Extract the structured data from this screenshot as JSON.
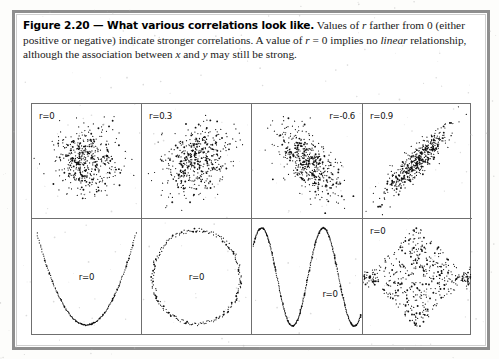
{
  "figure": {
    "label": "Figure 2.20 — What various correlations look like.",
    "body_part1": "Values of ",
    "r1": "r",
    "body_part2": " farther from 0 (either positive or negative) indicate stronger correlations.  A value of ",
    "r2": "r",
    "body_part3": " = 0 implies no ",
    "linear": "linear",
    "body_part4": " relationship, although the association between ",
    "x": "x",
    "body_part5": " and ",
    "y": "y",
    "body_part6": " may still be strong."
  },
  "colors": {
    "ink": "#1a1a1a",
    "frame": "#8e8e8e",
    "grid_line": "#6f6f6f",
    "point": "#101010",
    "paper": "#ffffff"
  },
  "chart_data": {
    "type": "scatter",
    "title": "What various correlations look like",
    "layout": {
      "rows": 2,
      "cols": 4,
      "grid": false,
      "axes_ticks": false,
      "legend": "none"
    },
    "panels": [
      {
        "id": "panel-r0-cloud",
        "row": 1,
        "col": 1,
        "label": "r=0",
        "label_position": "top-left",
        "shape": "round-cloud",
        "r": 0,
        "n": 480,
        "xlim": [
          -3,
          3
        ],
        "ylim": [
          -3,
          3
        ],
        "description": "Circular bivariate normal cloud, no linear trend"
      },
      {
        "id": "panel-r03",
        "row": 1,
        "col": 2,
        "label": "r=0.3",
        "label_position": "top-left",
        "shape": "tilted-cloud",
        "r": 0.3,
        "n": 480,
        "xlim": [
          -3,
          3
        ],
        "ylim": [
          -3,
          3
        ],
        "description": "Weak positive linear association"
      },
      {
        "id": "panel-r-06",
        "row": 1,
        "col": 3,
        "label": "r=-0.6",
        "label_position": "top-right",
        "shape": "tilted-cloud",
        "r": -0.6,
        "n": 480,
        "xlim": [
          -3,
          3
        ],
        "ylim": [
          -3,
          3
        ],
        "description": "Moderate negative linear association, downward slope"
      },
      {
        "id": "panel-r09",
        "row": 1,
        "col": 4,
        "label": "r=0.9",
        "label_position": "top-left",
        "shape": "tilted-cloud",
        "r": 0.9,
        "n": 480,
        "xlim": [
          -3,
          3
        ],
        "ylim": [
          -3,
          3
        ],
        "description": "Strong positive linear association, narrow diagonal band"
      },
      {
        "id": "panel-parabola",
        "row": 2,
        "col": 1,
        "label": "r=0",
        "label_position": "center",
        "shape": "parabola",
        "r": 0,
        "n": 150,
        "xlim": [
          -1,
          1
        ],
        "ylim": [
          0,
          1
        ],
        "description": "U-shaped quadratic curve, y = x^2, strong non-linear association"
      },
      {
        "id": "panel-circle",
        "row": 2,
        "col": 2,
        "label": "r=0",
        "label_position": "center",
        "shape": "circle",
        "r": 0,
        "n": 190,
        "xlim": [
          -1,
          1
        ],
        "ylim": [
          -1,
          1
        ],
        "description": "Ring of points on a circle"
      },
      {
        "id": "panel-sine",
        "row": 2,
        "col": 3,
        "label": "r=0",
        "label_position": "center-right",
        "shape": "sine",
        "r": 0,
        "n": 320,
        "xlim": [
          0,
          6.283
        ],
        "ylim": [
          -1,
          1
        ],
        "cycles": 1.75,
        "description": "Sine wave, strong non-linear association"
      },
      {
        "id": "panel-diamond",
        "row": 2,
        "col": 4,
        "label": "r=0",
        "label_position": "top-left",
        "shape": "diamond",
        "r": 0,
        "n": 430,
        "xlim": [
          -1,
          1
        ],
        "ylim": [
          -1,
          1
        ],
        "description": "Diamond-shaped uniform scatter with dense left and right vertices"
      }
    ]
  }
}
